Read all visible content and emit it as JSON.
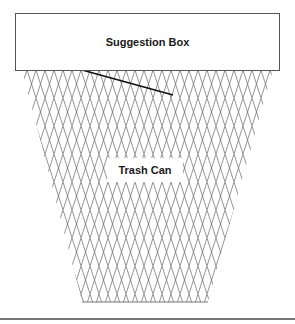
{
  "diagram": {
    "suggestion_box": {
      "label": "Suggestion Box"
    },
    "trash_can": {
      "label": "Trash Can"
    },
    "colors": {
      "line": "#555555",
      "mesh": "#666666",
      "background": "#ffffff"
    }
  }
}
